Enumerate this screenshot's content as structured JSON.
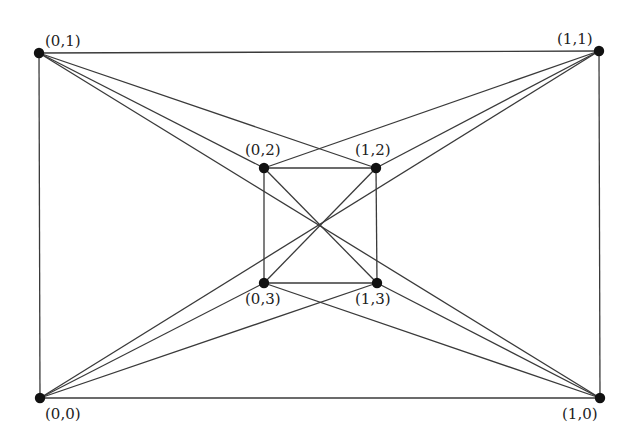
{
  "diagram": {
    "type": "graph",
    "vertices": [
      {
        "id": "0,1",
        "label": "(0,1)",
        "x": 39,
        "y": 53,
        "lx": 45,
        "ly": 46
      },
      {
        "id": "1,1",
        "label": "(1,1)",
        "x": 599,
        "y": 51,
        "lx": 557,
        "ly": 44
      },
      {
        "id": "0,0",
        "label": "(0,0)",
        "x": 40,
        "y": 398,
        "lx": 45,
        "ly": 419
      },
      {
        "id": "1,0",
        "label": "(1,0)",
        "x": 600,
        "y": 398,
        "lx": 562,
        "ly": 419
      },
      {
        "id": "0,2",
        "label": "(0,2)",
        "x": 264,
        "y": 168,
        "lx": 245,
        "ly": 155
      },
      {
        "id": "1,2",
        "label": "(1,2)",
        "x": 376,
        "y": 168,
        "lx": 355,
        "ly": 155
      },
      {
        "id": "0,3",
        "label": "(0,3)",
        "x": 264,
        "y": 283,
        "lx": 245,
        "ly": 304
      },
      {
        "id": "1,3",
        "label": "(1,3)",
        "x": 377,
        "y": 283,
        "lx": 355,
        "ly": 304
      }
    ],
    "edges": [
      [
        "0,1",
        "1,1"
      ],
      [
        "0,1",
        "0,0"
      ],
      [
        "0,0",
        "1,0"
      ],
      [
        "1,1",
        "1,0"
      ],
      [
        "0,2",
        "1,2"
      ],
      [
        "0,2",
        "0,3"
      ],
      [
        "0,3",
        "1,3"
      ],
      [
        "1,2",
        "1,3"
      ],
      [
        "0,2",
        "1,3"
      ],
      [
        "1,2",
        "0,3"
      ],
      [
        "0,1",
        "0,2"
      ],
      [
        "0,1",
        "1,2"
      ],
      [
        "0,1",
        "1,0"
      ],
      [
        "1,1",
        "1,2"
      ],
      [
        "1,1",
        "0,2"
      ],
      [
        "1,1",
        "0,0"
      ],
      [
        "0,0",
        "0,3"
      ],
      [
        "0,0",
        "1,3"
      ],
      [
        "1,0",
        "1,3"
      ],
      [
        "1,0",
        "0,3"
      ]
    ]
  }
}
